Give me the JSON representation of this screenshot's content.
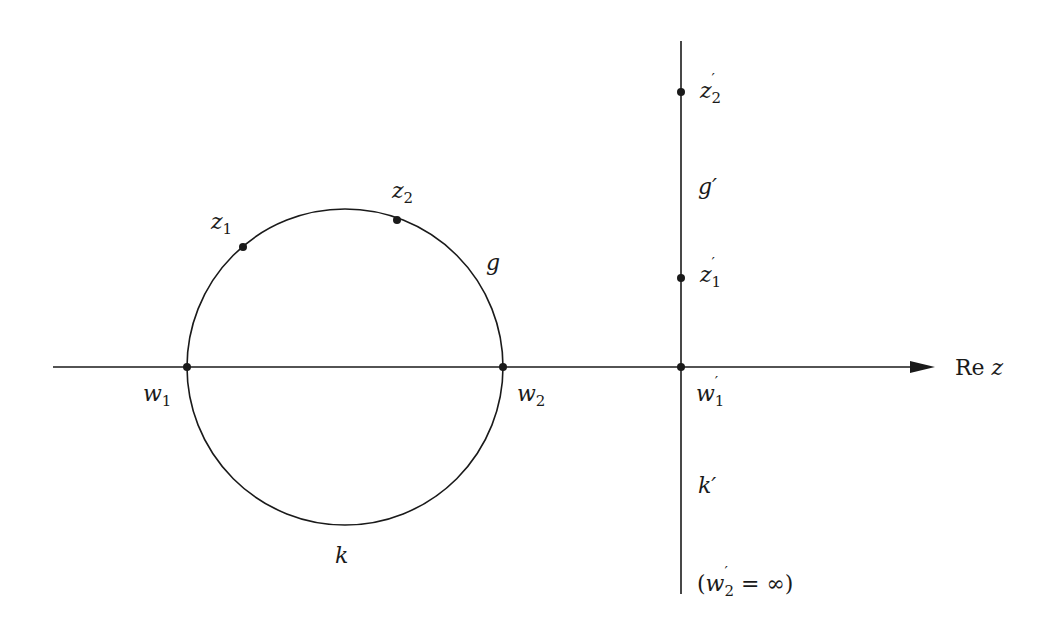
{
  "diagram": {
    "colors": {
      "stroke": "#1a1a1a",
      "background": "#ffffff"
    },
    "axis": {
      "label_main": "Re",
      "label_var": "z"
    },
    "circle": {
      "name": "g_k",
      "upper_arc_label": "g",
      "lower_arc_label": "k"
    },
    "points_left": {
      "z1": {
        "base": "z",
        "sub": "1"
      },
      "z2": {
        "base": "z",
        "sub": "2"
      },
      "w1": {
        "base": "w",
        "sub": "1"
      },
      "w2": {
        "base": "w",
        "sub": "2"
      }
    },
    "line_right": {
      "upper_label": "g′",
      "lower_label": "k′",
      "z2p": {
        "base": "z",
        "prime": "′",
        "sub": "2"
      },
      "z1p": {
        "base": "z",
        "prime": "′",
        "sub": "1"
      },
      "w1p": {
        "base": "w",
        "prime": "′",
        "sub": "1"
      },
      "w2p_note": {
        "open": "(",
        "base": "w",
        "prime": "′",
        "sub": "2",
        "rest": " = ∞)"
      }
    }
  }
}
